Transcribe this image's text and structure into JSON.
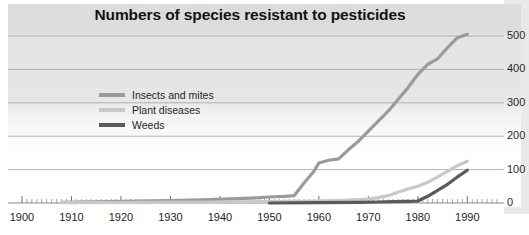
{
  "chart_data": {
    "type": "line",
    "title": "Numbers of species resistant to pesticides",
    "xlabel": "",
    "ylabel": "",
    "xlim": [
      1900,
      1996
    ],
    "ylim": [
      0,
      530
    ],
    "grid": true,
    "legend_position": "upper-left-inside",
    "y_ticks": [
      "0",
      "100",
      "200",
      "300",
      "400",
      "500"
    ],
    "y_tick_values": [
      0,
      100,
      200,
      300,
      400,
      500
    ],
    "x_ticks": [
      "1900",
      "1910",
      "1920",
      "1930",
      "1940",
      "1950",
      "1960",
      "1970",
      "1980",
      "1990"
    ],
    "x_tick_values": [
      1900,
      1910,
      1920,
      1930,
      1940,
      1950,
      1960,
      1970,
      1980,
      1990
    ],
    "series": [
      {
        "name": "Insects and mites",
        "color": "#9a9a9a",
        "x": [
          1908,
          1920,
          1930,
          1938,
          1945,
          1948,
          1950,
          1953,
          1955,
          1957,
          1959,
          1960,
          1962,
          1964,
          1966,
          1968,
          1970,
          1972,
          1974,
          1976,
          1978,
          1980,
          1982,
          1984,
          1986,
          1988,
          1990
        ],
        "values": [
          2,
          5,
          7,
          10,
          14,
          16,
          18,
          20,
          22,
          60,
          95,
          120,
          128,
          132,
          160,
          185,
          215,
          245,
          275,
          310,
          345,
          385,
          415,
          432,
          465,
          495,
          505
        ]
      },
      {
        "name": "Plant diseases",
        "color": "#c8c8c8",
        "x": [
          1908,
          1925,
          1940,
          1950,
          1955,
          1960,
          1965,
          1968,
          1970,
          1972,
          1974,
          1976,
          1978,
          1980,
          1982,
          1984,
          1986,
          1988,
          1990
        ],
        "values": [
          1,
          2,
          3,
          4,
          5,
          6,
          8,
          10,
          12,
          16,
          22,
          32,
          42,
          50,
          62,
          78,
          95,
          112,
          125
        ]
      },
      {
        "name": "Weeds",
        "color": "#5a5a5a",
        "x": [
          1950,
          1960,
          1968,
          1972,
          1975,
          1978,
          1980,
          1982,
          1984,
          1986,
          1988,
          1990
        ],
        "values": [
          0,
          1,
          2,
          3,
          4,
          5,
          6,
          20,
          38,
          56,
          78,
          98
        ]
      }
    ]
  }
}
